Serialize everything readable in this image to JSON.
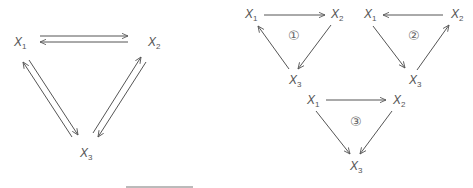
{
  "diagram": {
    "left": {
      "nodes": [
        {
          "id": "X1",
          "label": "X",
          "sub": "1"
        },
        {
          "id": "X2",
          "label": "X",
          "sub": "2"
        },
        {
          "id": "X3",
          "label": "X",
          "sub": "3"
        }
      ],
      "edges": [
        "X1->X2",
        "X2->X1",
        "X1->X3",
        "X3->X1",
        "X2->X3",
        "X3->X2"
      ]
    },
    "cycles": [
      {
        "badge": "①",
        "nodes": {
          "X1": {
            "label": "X",
            "sub": "1"
          },
          "X2": {
            "label": "X",
            "sub": "2"
          },
          "X3": {
            "label": "X",
            "sub": "3"
          }
        },
        "edges": [
          "X1->X2",
          "X2->X3",
          "X3->X1"
        ]
      },
      {
        "badge": "②",
        "nodes": {
          "X1": {
            "label": "X",
            "sub": "1"
          },
          "X2": {
            "label": "X",
            "sub": "2"
          },
          "X3": {
            "label": "X",
            "sub": "3"
          }
        },
        "edges": [
          "X2->X1",
          "X1->X3",
          "X3->X2"
        ]
      },
      {
        "badge": "③",
        "nodes": {
          "X1": {
            "label": "X",
            "sub": "1"
          },
          "X2": {
            "label": "X",
            "sub": "2"
          },
          "X3": {
            "label": "X",
            "sub": "3"
          }
        },
        "edges": [
          "X1->X2",
          "X1->X3",
          "X2->X3"
        ]
      }
    ],
    "colors": {
      "stroke": "#555555",
      "text": "#555555"
    }
  }
}
